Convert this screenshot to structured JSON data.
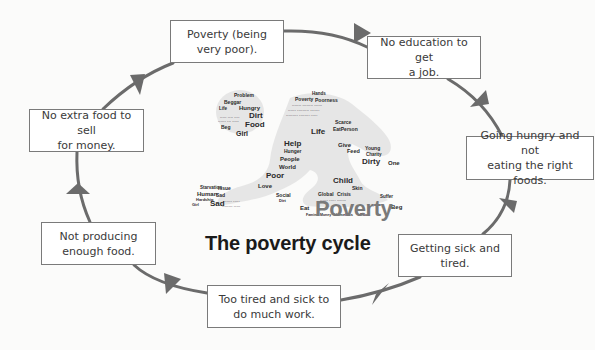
{
  "title": "The poverty cycle",
  "colors": {
    "arrow": "#6b6b6b",
    "box_border": "#7a7a7a",
    "box_text": "#3a3a3a",
    "word_cloud_highlight": "#7a7a7a"
  },
  "cycle_steps": [
    {
      "label": "Poverty (being\nvery poor)."
    },
    {
      "label": "No education to get\na job."
    },
    {
      "label": "Going hungry and not\neating the right foods."
    },
    {
      "label": "Getting sick and\ntired."
    },
    {
      "label": "Too tired and sick to\ndo much work."
    },
    {
      "label": "Not producing\nenough food."
    },
    {
      "label": "No extra food to sell\nfor money."
    }
  ],
  "word_cloud": {
    "headline_word": "Poverty",
    "words": [
      "Problem",
      "Beggar",
      "Life",
      "Hungry",
      "Dirt",
      "Food",
      "Girl",
      "Beg",
      "Hands",
      "Poverty",
      "Poorness",
      "Help",
      "Hunger",
      "People",
      "World",
      "Poor",
      "Love",
      "Social",
      "Dirt",
      "Life",
      "Scarce",
      "EatPerson",
      "Give",
      "Feed",
      "Young",
      "Charity",
      "Dirty",
      "One",
      "Child",
      "Skin",
      "Global",
      "Crisis",
      "Eat",
      "Suffer",
      "Beg",
      "Famine",
      "Money",
      "Homeless",
      "Poor",
      "Starvation",
      "Issue",
      "Human",
      "Sad",
      "Hardship",
      "Girl",
      "Sad"
    ]
  }
}
